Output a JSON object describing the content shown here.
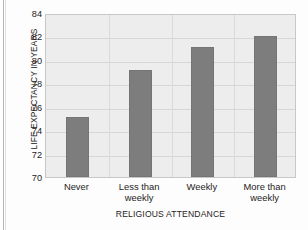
{
  "chart_data": {
    "type": "bar",
    "title": "",
    "xlabel": "RELIGIOUS ATTENDANCE",
    "ylabel": "LIFE EXPECTANCY IN YEARS",
    "categories": [
      "Never",
      "Less than weekly",
      "Weekly",
      "More than weekly"
    ],
    "category_lines": [
      [
        "Never"
      ],
      [
        "Less than",
        "weekly"
      ],
      [
        "Weekly"
      ],
      [
        "More than",
        "weekly"
      ]
    ],
    "values": [
      75.1,
      79.1,
      81.1,
      82.0
    ],
    "ylim": [
      70,
      84
    ],
    "yticks": [
      70,
      72,
      74,
      76,
      78,
      80,
      82,
      84
    ],
    "ytick_labels": [
      "70",
      "72",
      "74",
      "76",
      "78",
      "80",
      "82",
      "84"
    ],
    "grid": "horizontal-and-category-separators",
    "legend": "none",
    "bar_color": "#7d7d7d",
    "plot_background": "#ededed"
  }
}
